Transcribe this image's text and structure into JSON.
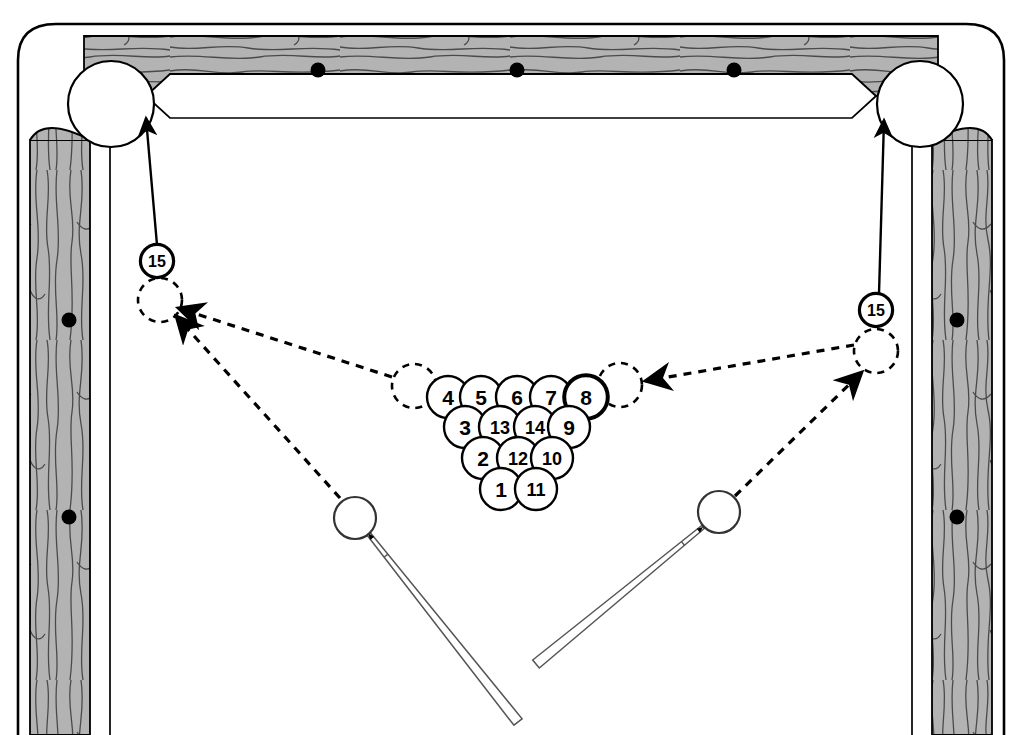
{
  "diagram": {
    "type": "billiards-table-top-view"
  },
  "table": {
    "rail_color": "#b3b3b3",
    "rail_grain_color": "#4d4d4d",
    "cloth_color": "#ffffff",
    "outline_color": "#000000",
    "diamond_color": "#000000",
    "top_rail_diamonds": 3,
    "left_rail_diamonds": 2,
    "right_rail_diamonds": 2
  },
  "pockets": [
    {
      "name": "top-left-corner-pocket",
      "cx": 111,
      "cy": 104,
      "r": 43
    },
    {
      "name": "top-right-corner-pocket",
      "cx": 920,
      "cy": 104,
      "r": 43
    }
  ],
  "rack": {
    "label": "ball-rack-triangle",
    "ball_radius": 21,
    "rows": [
      {
        "row": 1,
        "balls": [
          {
            "number": "4",
            "cx": 448,
            "cy": 397,
            "highlight": false
          },
          {
            "number": "5",
            "cx": 481,
            "cy": 397,
            "highlight": false
          },
          {
            "number": "6",
            "cx": 517,
            "cy": 397,
            "highlight": false
          },
          {
            "number": "7",
            "cx": 551,
            "cy": 397,
            "highlight": false
          },
          {
            "number": "8",
            "cx": 586,
            "cy": 397,
            "highlight": true
          }
        ]
      },
      {
        "row": 2,
        "balls": [
          {
            "number": "3",
            "cx": 465,
            "cy": 427,
            "highlight": false
          },
          {
            "number": "13",
            "cx": 500,
            "cy": 427,
            "highlight": false
          },
          {
            "number": "14",
            "cx": 535,
            "cy": 427,
            "highlight": false
          },
          {
            "number": "9",
            "cx": 569,
            "cy": 427,
            "highlight": false
          }
        ]
      },
      {
        "row": 3,
        "balls": [
          {
            "number": "2",
            "cx": 483,
            "cy": 458,
            "highlight": false
          },
          {
            "number": "12",
            "cx": 518,
            "cy": 458,
            "highlight": false
          },
          {
            "number": "10",
            "cx": 552,
            "cy": 458,
            "highlight": false
          }
        ]
      },
      {
        "row": 4,
        "balls": [
          {
            "number": "1",
            "cx": 501,
            "cy": 489,
            "highlight": false
          },
          {
            "number": "11",
            "cx": 536,
            "cy": 489,
            "highlight": false
          }
        ]
      }
    ]
  },
  "key_balls": [
    {
      "name": "fifteen-ball-left",
      "number": "15",
      "tag_cx": 157,
      "tag_cy": 261,
      "tag_r": 16,
      "ghost_cx": 160,
      "ghost_cy": 300,
      "ghost_r": 22
    },
    {
      "name": "fifteen-ball-right",
      "number": "15",
      "tag_cx": 876,
      "tag_cy": 310,
      "tag_r": 16,
      "ghost_cx": 876,
      "ghost_cy": 351,
      "ghost_r": 22
    }
  ],
  "ghost_balls": [
    {
      "name": "ghost-ball-rack-left",
      "cx": 414,
      "cy": 386,
      "r": 22
    },
    {
      "name": "ghost-ball-rack-right",
      "cx": 620,
      "cy": 385,
      "r": 22
    }
  ],
  "cue_balls": [
    {
      "name": "cue-ball-left",
      "cx": 355,
      "cy": 518,
      "r": 21
    },
    {
      "name": "cue-ball-right",
      "cx": 719,
      "cy": 512,
      "r": 21
    }
  ],
  "cue_sticks": [
    {
      "name": "cue-stick-left",
      "tip_x": 368,
      "tip_y": 533,
      "butt_x": 518,
      "butt_y": 722
    },
    {
      "name": "cue-stick-right",
      "tip_x": 703,
      "tip_y": 527,
      "butt_x": 536,
      "butt_y": 664
    }
  ],
  "paths": {
    "solid_pocket_paths": [
      {
        "name": "path-fifteen-left-to-top-left-pocket",
        "style": "solid",
        "from_x": 157,
        "from_y": 245,
        "to_x": 146,
        "to_y": 118
      },
      {
        "name": "path-fifteen-right-to-top-right-pocket",
        "style": "solid",
        "from_x": 879,
        "from_y": 294,
        "to_x": 884,
        "to_y": 120
      }
    ],
    "dashed_paths": [
      {
        "name": "path-cue-left-to-fifteen-left",
        "style": "dashed",
        "from_x": 340,
        "from_y": 498,
        "to_x": 176,
        "to_y": 316
      },
      {
        "name": "path-ghost-rack-left-to-fifteen-left",
        "style": "dashed",
        "from_x": 392,
        "from_y": 377,
        "to_x": 178,
        "to_y": 308
      },
      {
        "name": "path-fifteen-right-to-ghost-rack-right",
        "style": "dashed",
        "from_x": 854,
        "from_y": 345,
        "to_x": 645,
        "to_y": 381
      },
      {
        "name": "path-cue-right-to-fifteen-right",
        "style": "dashed",
        "from_x": 735,
        "from_y": 496,
        "to_x": 862,
        "to_y": 372
      }
    ]
  }
}
